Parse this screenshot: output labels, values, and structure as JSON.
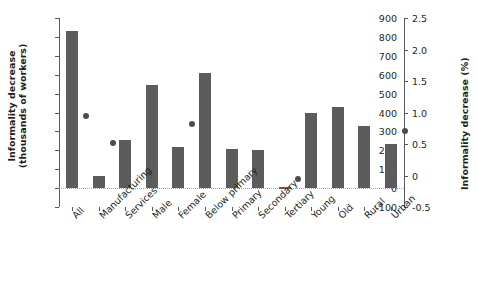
{
  "chart_data": {
    "type": "bar",
    "title": "",
    "categories": [
      "All",
      "Manufacturing",
      "Services",
      "Male",
      "Female",
      "Below primary",
      "Primary",
      "Secondary",
      "Tertiary",
      "Young",
      "Old",
      "Rural",
      "Urban"
    ],
    "series": [
      {
        "name": "Informality decrease (thousands of workers)",
        "type": "bar",
        "axis": "left",
        "color": "#5c5c5c",
        "values": [
          830,
          65,
          255,
          545,
          215,
          610,
          205,
          200,
          5,
          395,
          430,
          330,
          235
        ]
      },
      {
        "name": "Informality decrease (%)",
        "type": "scatter",
        "axis": "right",
        "color": "#4d4d4d",
        "values": [
          0.95,
          0.52,
          null,
          null,
          0.82,
          null,
          null,
          null,
          -0.05,
          null,
          null,
          null,
          0.7
        ]
      }
    ],
    "xlabel": "",
    "ylabel": "Informality decrease (thousands of workers)",
    "y2label": "Informality decrease (%)",
    "ylim": [
      -100,
      900
    ],
    "y2lim": [
      -0.5,
      2.5
    ],
    "yticks": [
      "-100",
      "0",
      "100",
      "200",
      "300",
      "400",
      "500",
      "600",
      "700",
      "800",
      "900"
    ],
    "ytick_values": [
      -100,
      0,
      100,
      200,
      300,
      400,
      500,
      600,
      700,
      800,
      900
    ],
    "y2ticks": [
      "-0.5",
      "0",
      "0.5",
      "1.0",
      "1.5",
      "2.0",
      "2.5"
    ],
    "y2tick_values": [
      -0.5,
      0,
      0.5,
      1.0,
      1.5,
      2.0,
      2.5
    ],
    "grid": false,
    "legend": "none"
  }
}
